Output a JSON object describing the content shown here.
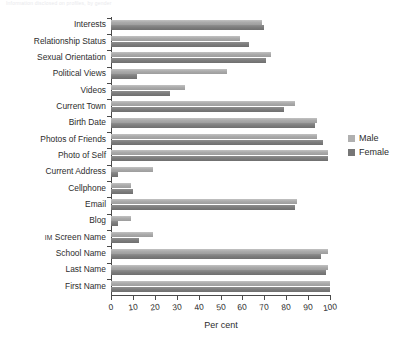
{
  "top_caption": "Information disclosed on profiles, by gender",
  "legend": {
    "position": "right",
    "entries": [
      {
        "name": "Male",
        "color": "#b0b0b0"
      },
      {
        "name": "Female",
        "color": "#767676"
      }
    ]
  },
  "axis": {
    "xlabel": "Per cent",
    "xticks": [
      "0",
      "10",
      "20",
      "30",
      "40",
      "50",
      "60",
      "70",
      "80",
      "90",
      "100"
    ]
  },
  "chart_data": {
    "type": "bar",
    "orientation": "horizontal",
    "title": "",
    "xlabel": "Per cent",
    "ylabel": "",
    "xlim": [
      0,
      100
    ],
    "grid": false,
    "legend_position": "right",
    "categories": [
      "Interests",
      "Relationship Status",
      "Sexual Orientation",
      "Political Views",
      "Videos",
      "Current Town",
      "Birth Date",
      "Photos of Friends",
      "Photo of Self",
      "Current Address",
      "Cellphone",
      "Email",
      "Blog",
      "IM Screen Name",
      "School Name",
      "Last Name",
      "First Name"
    ],
    "series": [
      {
        "name": "Male",
        "color": "#b0b0b0",
        "values": [
          69,
          59,
          73,
          53,
          34,
          84,
          94,
          94,
          99,
          19,
          9,
          85,
          9,
          19,
          99,
          99,
          100
        ]
      },
      {
        "name": "Female",
        "color": "#767676",
        "values": [
          70,
          63,
          71,
          12,
          27,
          79,
          93,
          97,
          99,
          3,
          10,
          84,
          3,
          13,
          96,
          98,
          100
        ]
      }
    ]
  }
}
